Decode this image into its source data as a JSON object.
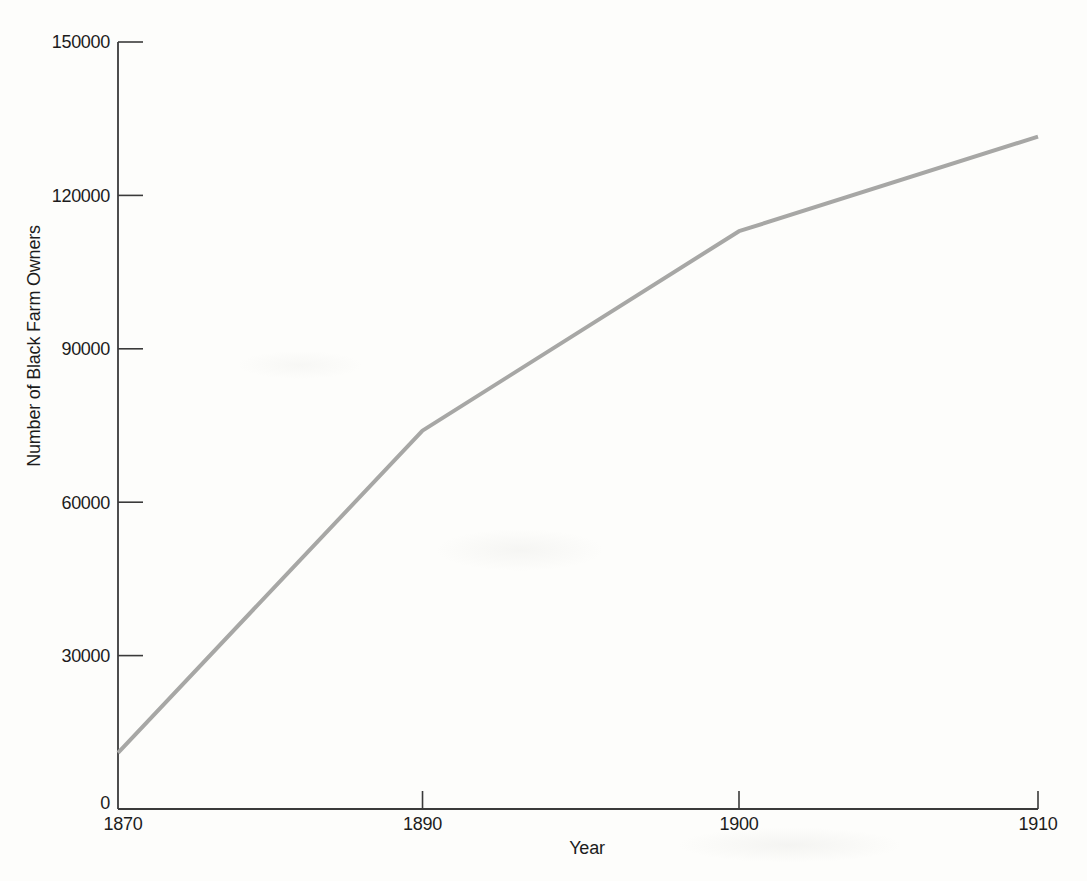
{
  "chart_data": {
    "type": "line",
    "title": "",
    "xlabel": "Year",
    "ylabel": "Number of Black Farm Owners",
    "categories": [
      "1870",
      "1890",
      "1900",
      "1910"
    ],
    "series": [
      {
        "name": "Number of Black Farm Owners",
        "values": [
          11000,
          74000,
          113000,
          131500
        ]
      }
    ],
    "ylim": [
      0,
      150000
    ],
    "yticks": [
      0,
      30000,
      60000,
      90000,
      120000,
      150000
    ],
    "ytick_labels": [
      "0",
      "30000",
      "60000",
      "90000",
      "120000",
      "150000"
    ],
    "x_frac": [
      0,
      0.331,
      0.675,
      1.0
    ],
    "grid": false,
    "legend": false,
    "tick_style": "inward",
    "line_color": "#a7a7a5",
    "axis_color": "#3a3a3a",
    "text_color": "#1c1c1c"
  }
}
